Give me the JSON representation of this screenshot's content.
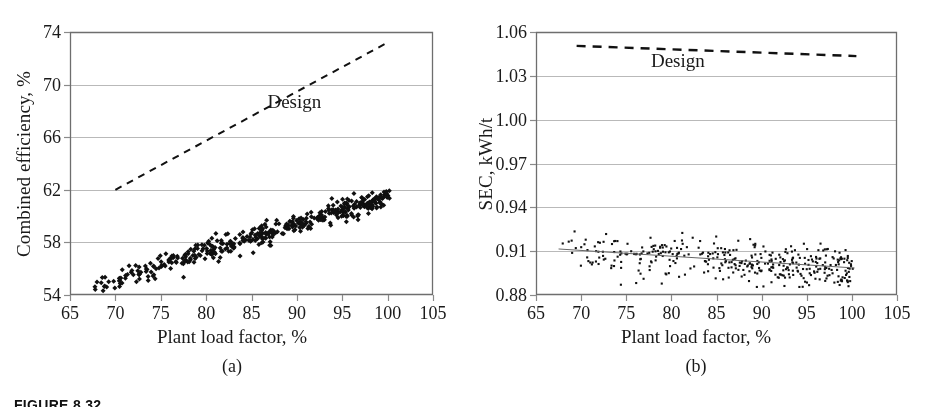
{
  "figure": {
    "caption": "FIGURE 8.32",
    "panels": [
      "a",
      "b"
    ]
  },
  "chart_data": [
    {
      "type": "scatter",
      "panel_label": "(a)",
      "title": "",
      "xlabel": "Plant load factor, %",
      "ylabel": "Combined efficiency, %",
      "xlim": [
        65,
        105
      ],
      "ylim": [
        54,
        74
      ],
      "xticks": [
        65,
        70,
        75,
        80,
        85,
        90,
        95,
        100,
        105
      ],
      "xtick_labels": [
        "65",
        "70",
        "75",
        "80",
        "85",
        "90",
        "95",
        "100",
        "105"
      ],
      "yticks": [
        54,
        58,
        62,
        66,
        70,
        74
      ],
      "ytick_labels": [
        "54",
        "58",
        "62",
        "66",
        "70",
        "74"
      ],
      "grid": "horizontal",
      "legend": "inline-annotation",
      "series": [
        {
          "name": "Design",
          "style": "dashed-line",
          "color": "#111111",
          "annotation": "Design",
          "annotation_x": 90.5,
          "annotation_y": 68.6,
          "x": [
            70,
            100
          ],
          "y": [
            62.0,
            73.2
          ]
        },
        {
          "name": "Measured",
          "style": "scatter-cloud",
          "color": "#101010",
          "marker": "diamond",
          "n_points": 430,
          "x_range": [
            67.4,
            100.2
          ],
          "y_range": [
            54.2,
            62.1
          ],
          "trend": {
            "x": [
              67.4,
              100.2
            ],
            "y": [
              54.6,
              61.6
            ]
          },
          "scatter_sd": 0.38
        }
      ]
    },
    {
      "type": "scatter",
      "panel_label": "(b)",
      "title": "",
      "xlabel": "Plant load factor, %",
      "ylabel": "SEC, kWh/t",
      "xlim": [
        65,
        105
      ],
      "ylim": [
        0.88,
        1.06
      ],
      "xticks": [
        65,
        70,
        75,
        80,
        85,
        90,
        95,
        100,
        105
      ],
      "xtick_labels": [
        "65",
        "70",
        "75",
        "80",
        "85",
        "90",
        "95",
        "100",
        "105"
      ],
      "yticks": [
        0.88,
        0.91,
        0.94,
        0.97,
        1.0,
        1.03,
        1.06
      ],
      "ytick_labels": [
        "0.88",
        "0.91",
        "0.94",
        "0.97",
        "1.00",
        "1.03",
        "1.06"
      ],
      "grid": "horizontal",
      "legend": "inline-annotation",
      "series": [
        {
          "name": "Design",
          "style": "dashed-line",
          "color": "#111111",
          "annotation": "Design",
          "annotation_x": 81.5,
          "annotation_y": 1.0395,
          "x": [
            69.5,
            100.5
          ],
          "y": [
            1.0505,
            1.0435
          ]
        },
        {
          "name": "Measured",
          "style": "scatter-cloud",
          "color": "#101010",
          "marker": "square",
          "n_points": 390,
          "x_range": [
            67.5,
            100.3
          ],
          "y_range": [
            0.8855,
            0.9235
          ],
          "trend": {
            "x": [
              67.5,
              100.3
            ],
            "y": [
              0.9115,
              0.8985
            ]
          },
          "scatter_sd": 0.0055
        }
      ]
    }
  ]
}
